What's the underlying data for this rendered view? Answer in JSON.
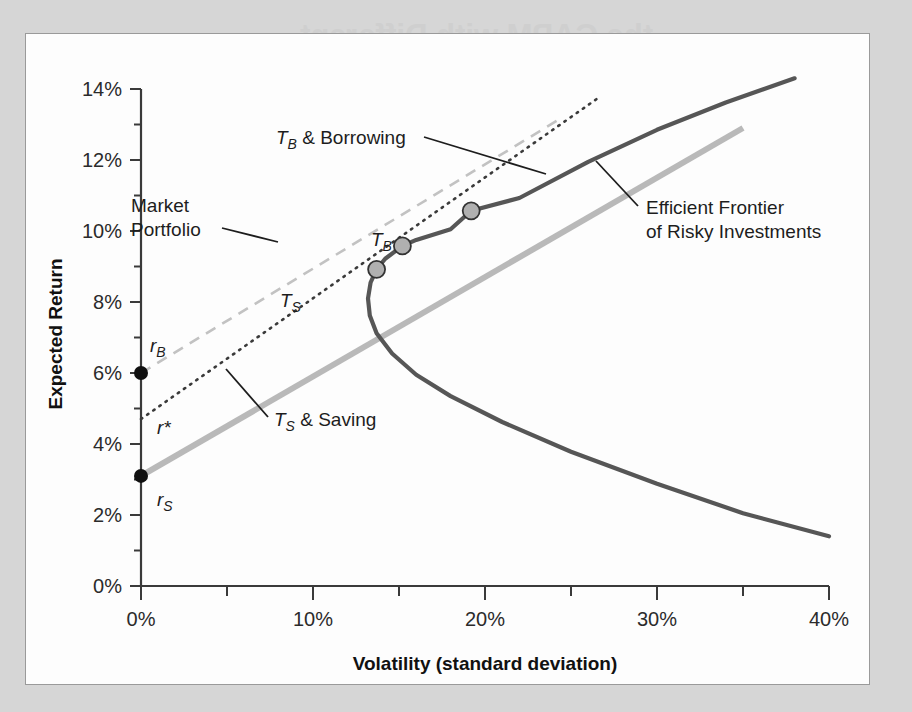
{
  "figure": {
    "background_color": "#d6d6d6",
    "panel_color": "#fdfdfd",
    "panel_border_color": "#9a9a9a",
    "ghost_text": [
      "the CAPM with Different",
      "Borrowing Rates",
      "The Security Market Line with",
      "Different Saving and Borrowing Rates"
    ]
  },
  "chart_data": {
    "type": "line",
    "title": "",
    "xlabel": "Volatility (standard deviation)",
    "ylabel": "Expected Return",
    "xlim": [
      0,
      40
    ],
    "ylim": [
      0,
      14
    ],
    "xticks": [
      0,
      10,
      20,
      30,
      40
    ],
    "xticklabels": [
      "0%",
      "10%",
      "20%",
      "30%",
      "40%"
    ],
    "x_minor_ticks": [
      5,
      15,
      25,
      35
    ],
    "yticks": [
      0,
      2,
      4,
      6,
      8,
      10,
      12,
      14
    ],
    "yticklabels": [
      "0%",
      "2%",
      "4%",
      "6%",
      "8%",
      "10%",
      "12%",
      "14%"
    ],
    "y_minor_ticks": [
      1,
      3,
      5,
      7,
      9,
      11,
      13
    ],
    "grid": false,
    "legend_position": "none",
    "series": [
      {
        "name": "Efficient Frontier of Risky Investments",
        "style": "solid",
        "color": "#565656",
        "width": 4.2,
        "note": "mean-variance hyperbola; minimum-variance point at (13.2%, 8.0%)",
        "points": [
          [
            38.0,
            14.3
          ],
          [
            34.0,
            13.62
          ],
          [
            30.0,
            12.85
          ],
          [
            26.0,
            11.95
          ],
          [
            22.0,
            10.93
          ],
          [
            19.2,
            10.57
          ],
          [
            18.0,
            10.05
          ],
          [
            16.0,
            9.75
          ],
          [
            15.2,
            9.58
          ],
          [
            14.2,
            9.22
          ],
          [
            13.7,
            8.92
          ],
          [
            13.35,
            8.55
          ],
          [
            13.2,
            8.1
          ],
          [
            13.3,
            7.62
          ],
          [
            13.7,
            7.12
          ],
          [
            14.6,
            6.55
          ],
          [
            16.0,
            5.95
          ],
          [
            18.0,
            5.35
          ],
          [
            21.0,
            4.62
          ],
          [
            25.0,
            3.78
          ],
          [
            30.0,
            2.88
          ],
          [
            35.0,
            2.05
          ],
          [
            40.0,
            1.4
          ]
        ]
      },
      {
        "name": "T_S & Saving",
        "style": "solid",
        "color": "#b9b9b9",
        "width": 6,
        "note": "capital allocation line at the saving rate; intercept r_S, tangent at T_S",
        "intercept": 3.1,
        "tangency_point": [
          13.7,
          8.92
        ],
        "endpoint": [
          35.0,
          12.9
        ]
      },
      {
        "name": "Market Portfolio line",
        "style": "dotted",
        "color": "#3a3a3a",
        "width": 2.6,
        "note": "line at the effective market rate r*; passes through the Market Portfolio",
        "intercept": 4.7,
        "tangency_point": [
          15.2,
          9.58
        ],
        "endpoint": [
          26.5,
          13.72
        ]
      },
      {
        "name": "T_B & Borrowing",
        "style": "dashed",
        "color": "#c2c2c2",
        "width": 2.6,
        "note": "capital allocation line at the borrowing rate; intercept r_B, tangent at T_B",
        "intercept": 6.0,
        "tangency_point": [
          19.2,
          10.57
        ],
        "endpoint": [
          24.5,
          13.2
        ]
      }
    ],
    "markers": [
      {
        "label": "T_S",
        "x": 13.7,
        "y": 8.92,
        "style": "open-circle-gray"
      },
      {
        "label": "Market Portfolio",
        "x": 15.2,
        "y": 9.58,
        "style": "open-circle-gray"
      },
      {
        "label": "T_B",
        "x": 19.2,
        "y": 10.57,
        "style": "open-circle-gray"
      },
      {
        "label": "r_B",
        "x": 0.0,
        "y": 6.0,
        "style": "filled-dot-black"
      },
      {
        "label": "r_S",
        "x": 0.0,
        "y": 3.1,
        "style": "filled-dot-black"
      }
    ],
    "annotations": [
      {
        "id": "tb-borrowing",
        "base": "T",
        "sub": "B",
        "rest": " & Borrowing",
        "x": 18.5,
        "y": 12.6
      },
      {
        "id": "market-portfolio",
        "base": "Market Portfolio",
        "sub": "",
        "rest": "",
        "x": 11.0,
        "y": 11.05
      },
      {
        "id": "efficient-frontier",
        "base": "Efficient Frontier",
        "sub": "",
        "rest": "of Risky Investments",
        "x": 28.0,
        "y": 11.2
      },
      {
        "id": "ts-saving",
        "base": "T",
        "sub": "S",
        "rest": " & Saving",
        "x": 9.5,
        "y": 4.6
      },
      {
        "id": "ts-marker-label",
        "base": "T",
        "sub": "S",
        "rest": "",
        "x": 15.2,
        "y": 8.3
      },
      {
        "id": "tb-marker-label",
        "base": "T",
        "sub": "B",
        "rest": "",
        "x": 20.5,
        "y": 9.85
      },
      {
        "id": "rb-label",
        "base": "r",
        "sub": "B",
        "rest": "",
        "x": 0.6,
        "y": 6.7
      },
      {
        "id": "rstar-label",
        "base": "r*",
        "sub": "",
        "rest": "",
        "x": 1.2,
        "y": 4.45
      },
      {
        "id": "rs-label",
        "base": "r",
        "sub": "S",
        "rest": "",
        "x": 1.2,
        "y": 2.45
      }
    ],
    "annotation_text": {
      "tb_borrowing_base": "T",
      "tb_borrowing_sub": "B",
      "tb_borrowing_rest": " & Borrowing",
      "market_portfolio_line1": "Market",
      "market_portfolio_line2": "Portfolio",
      "efficient_frontier_line1": "Efficient Frontier",
      "efficient_frontier_line2": "of Risky Investments",
      "ts_saving_base": "T",
      "ts_saving_sub": "S",
      "ts_saving_rest": " & Saving",
      "ts_marker_base": "T",
      "ts_marker_sub": "S",
      "tb_marker_base": "T",
      "tb_marker_sub": "B",
      "rb_base": "r",
      "rb_sub": "B",
      "rstar_base": "r*",
      "rs_base": "r",
      "rs_sub": "S"
    }
  }
}
